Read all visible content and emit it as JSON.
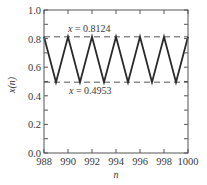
{
  "chart_data": {
    "type": "line",
    "title": "",
    "xlabel": "n",
    "ylabel": "x(n)",
    "xlim": [
      988,
      1000
    ],
    "ylim": [
      0.0,
      1.0
    ],
    "grid": false,
    "legend": null,
    "x_ticks": [
      988,
      990,
      992,
      994,
      996,
      998,
      1000
    ],
    "x_tick_labels": [
      "988",
      "990",
      "992",
      "994",
      "996",
      "998",
      "1000"
    ],
    "y_ticks": [
      0.0,
      0.2,
      0.4,
      0.6,
      0.8,
      1.0
    ],
    "y_tick_labels": [
      "0.0",
      "0.2",
      "0.4",
      "0.6",
      "0.8",
      "1.0"
    ],
    "series": [
      {
        "name": "x(n)",
        "style": "solid",
        "color": "#2a2a2a",
        "x": [
          988,
          989,
          990,
          991,
          992,
          993,
          994,
          995,
          996,
          997,
          998,
          999,
          1000
        ],
        "values": [
          0.8124,
          0.4953,
          0.8124,
          0.4953,
          0.8124,
          0.4953,
          0.8124,
          0.4953,
          0.8124,
          0.4953,
          0.8124,
          0.4953,
          0.8124
        ]
      }
    ],
    "reference_lines": [
      {
        "y": 0.8124,
        "style": "dashed",
        "color": "#555555",
        "label": "x = 0.8124"
      },
      {
        "y": 0.4953,
        "style": "dashed",
        "color": "#555555",
        "label": "x = 0.4953"
      }
    ],
    "annotations": [
      {
        "text": "x = 0.8124",
        "var": "x",
        "value": "= 0.8124",
        "position": "above upper dashed line, near n=990"
      },
      {
        "text": "x = 0.4953",
        "var": "x",
        "value": "= 0.4953",
        "position": "below lower dashed line, near n=990"
      }
    ]
  },
  "labels": {
    "xlabel": "n",
    "ylabel": "x(n)",
    "annot_upper_var": "x",
    "annot_upper_value": " = 0.8124",
    "annot_lower_var": "x",
    "annot_lower_value": " = 0.4953"
  }
}
